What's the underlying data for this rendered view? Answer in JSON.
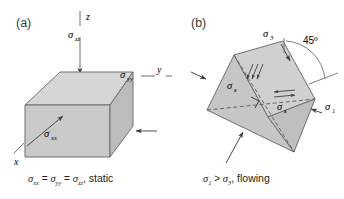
{
  "figure": {
    "panels": [
      {
        "id": "a",
        "letter": "(a)",
        "caption": "σxx = σyy = σzz, static",
        "caption_parts": {
          "s1": "σ",
          "sub1": "xx",
          "eq1": " = ",
          "s2": "σ",
          "sub2": "yy",
          "eq2": " = ",
          "s3": "σ",
          "sub3": "zz",
          "tail": ", static"
        },
        "axes": [
          {
            "name": "z-axis-label",
            "label": "z"
          },
          {
            "name": "y-axis-label",
            "label": "y"
          },
          {
            "name": "x-axis-label",
            "label": "x"
          }
        ],
        "stress_labels": [
          {
            "name": "sigma-zz-label",
            "symbol": "σ",
            "subscript": "zz"
          },
          {
            "name": "sigma-yy-label",
            "symbol": "σ",
            "subscript": "yy"
          },
          {
            "name": "sigma-xx-label",
            "symbol": "σ",
            "subscript": "xx"
          }
        ]
      },
      {
        "id": "b",
        "letter": "(b)",
        "caption": "σ1 > σ3, flowing",
        "caption_parts": {
          "s1": "σ",
          "sub1": "1",
          "gt": " > ",
          "s2": "σ",
          "sub2": "3",
          "tail": ", flowing"
        },
        "angle_label": "45º",
        "stress_labels": [
          {
            "name": "sigma-3-label",
            "symbol": "σ",
            "subscript": "3"
          },
          {
            "name": "sigma-1-label",
            "symbol": "σ",
            "subscript": "1"
          },
          {
            "name": "sigma-s-label-upper",
            "symbol": "σ",
            "subscript": "s"
          },
          {
            "name": "sigma-s-label-lower",
            "symbol": "σ",
            "subscript": "s"
          }
        ]
      }
    ],
    "colors": {
      "background": "#ffffff",
      "ink": "#231f20",
      "panel_letter": "#3a3a3a",
      "face_top": "#d4d4d4",
      "face_front": "#c9c9c9",
      "face_side": "#bdbdbd",
      "face_b_upper": "#cfcfcf",
      "face_b_lower": "#c4c4c4",
      "outline": "#6f6f6f",
      "arrow": "#4a4a4a",
      "dashed": "#5a5a5a"
    }
  }
}
